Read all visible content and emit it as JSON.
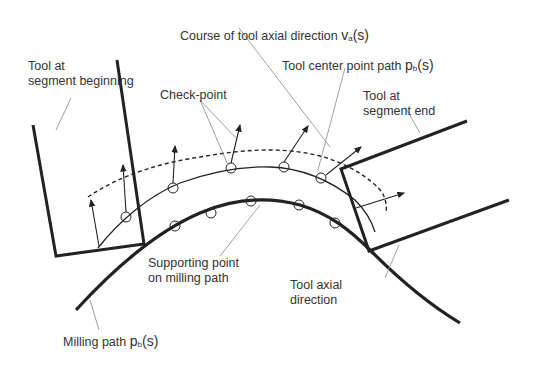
{
  "diagram": {
    "labels": {
      "course_axial": {
        "text": "Course of tool axial direction",
        "symbol": "v",
        "subscript": "a",
        "arg": "(s)"
      },
      "tool_begin": {
        "line1": "Tool  at",
        "line2": "segment beginning"
      },
      "tcp_path": {
        "text": "Tool  center point path",
        "symbol": "p",
        "subscript": "b",
        "arg": "(s)"
      },
      "tool_end": {
        "line1": "Tool at",
        "line2": "segment end"
      },
      "check_point": {
        "text": "Check-point"
      },
      "supporting_point": {
        "line1": "Supporting point",
        "line2": "on milling path"
      },
      "tool_axial_dir": {
        "line1": "Tool axial",
        "line2": "direction"
      },
      "milling_path": {
        "text": "Milling path",
        "symbol": "p",
        "subscript": "b",
        "arg": "(s)"
      }
    },
    "colors": {
      "line": "#222222",
      "leader": "#888888",
      "text": "#333333"
    }
  }
}
